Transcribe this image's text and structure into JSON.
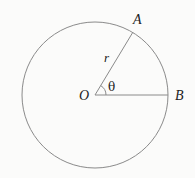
{
  "diagram": {
    "type": "circle-geometry",
    "colors": {
      "background": "#fbfbfa",
      "stroke": "#8a8a8a",
      "text": "#222222"
    },
    "circle": {
      "cx": 95,
      "cy": 95,
      "r": 73
    },
    "center": {
      "label": "O",
      "x": 95,
      "y": 95
    },
    "points": [
      {
        "id": "A",
        "label": "A",
        "x": 133,
        "y": 32
      },
      {
        "id": "B",
        "label": "B",
        "x": 168,
        "y": 95
      }
    ],
    "segments": [
      {
        "from": "O",
        "to": "A",
        "label": "r"
      },
      {
        "from": "O",
        "to": "B",
        "label": ""
      }
    ],
    "angle": {
      "label": "θ",
      "vertex": "O",
      "between": [
        "B",
        "A"
      ],
      "degrees": 59
    }
  }
}
